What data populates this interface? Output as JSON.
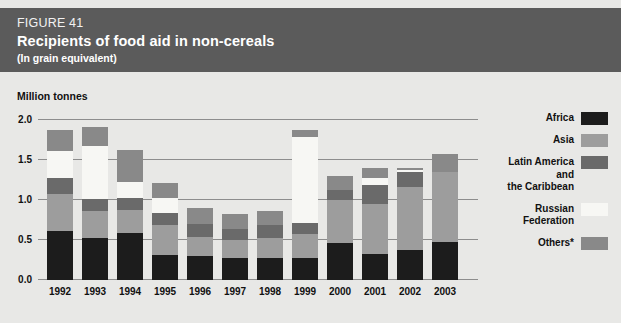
{
  "header": {
    "figure_number": "FIGURE 41",
    "title": "Recipients of food aid in non-cereals",
    "subtitle": "(In grain equivalent)",
    "band_color": "#5b5b5b"
  },
  "axis_unit_label": "Million tonnes",
  "legend": {
    "items": [
      {
        "label": "Africa",
        "color": "#1c1c1c",
        "key": "africa"
      },
      {
        "label": "Asia",
        "color": "#9d9d9d",
        "key": "asia"
      },
      {
        "label": "Latin America\nand\nthe Caribbean",
        "color": "#6a6a6a",
        "key": "latin_america"
      },
      {
        "label": "Russian\nFederation",
        "color": "#f7f7f4",
        "key": "russian_federation"
      },
      {
        "label": "Others*",
        "color": "#898989",
        "key": "others"
      }
    ]
  },
  "chart_data": {
    "type": "bar",
    "subtype": "stacked",
    "title": "Recipients of food aid in non-cereals",
    "subtitle": "(In grain equivalent)",
    "figure_number": "FIGURE 41",
    "xlabel": "",
    "ylabel": "Million tonnes",
    "ylim": [
      0.0,
      2.0
    ],
    "yticks": [
      "0.0",
      "0.5",
      "1.0",
      "1.5",
      "2.0"
    ],
    "ytick_values": [
      0.0,
      0.5,
      1.0,
      1.5,
      2.0
    ],
    "grid": true,
    "legend_position": "right",
    "footnote_marker": "*",
    "categories": [
      "1992",
      "1993",
      "1994",
      "1995",
      "1996",
      "1997",
      "1998",
      "1999",
      "2000",
      "2001",
      "2002",
      "2003"
    ],
    "series": [
      {
        "name": "Africa",
        "color": "#1c1c1c",
        "values": [
          0.61,
          0.53,
          0.59,
          0.31,
          0.3,
          0.28,
          0.28,
          0.28,
          0.46,
          0.32,
          0.37,
          0.48
        ]
      },
      {
        "name": "Asia",
        "color": "#9d9d9d",
        "values": [
          0.46,
          0.33,
          0.28,
          0.38,
          0.24,
          0.22,
          0.25,
          0.3,
          0.54,
          0.63,
          0.79,
          0.87
        ]
      },
      {
        "name": "Latin America and the Caribbean",
        "color": "#6a6a6a",
        "values": [
          0.21,
          0.15,
          0.15,
          0.15,
          0.16,
          0.14,
          0.16,
          0.13,
          0.12,
          0.24,
          0.19,
          0.0
        ]
      },
      {
        "name": "Russian Federation",
        "color": "#f7f7f4",
        "values": [
          0.33,
          0.67,
          0.21,
          0.19,
          0.0,
          0.0,
          0.0,
          1.08,
          0.0,
          0.09,
          0.03,
          0.0
        ]
      },
      {
        "name": "Others*",
        "color": "#898989",
        "values": [
          0.27,
          0.23,
          0.4,
          0.18,
          0.2,
          0.18,
          0.17,
          0.09,
          0.18,
          0.12,
          0.02,
          0.22
        ]
      }
    ],
    "totals": [
      1.88,
      1.91,
      1.63,
      1.21,
      0.9,
      0.82,
      0.86,
      1.88,
      1.3,
      1.4,
      1.4,
      1.57
    ]
  }
}
